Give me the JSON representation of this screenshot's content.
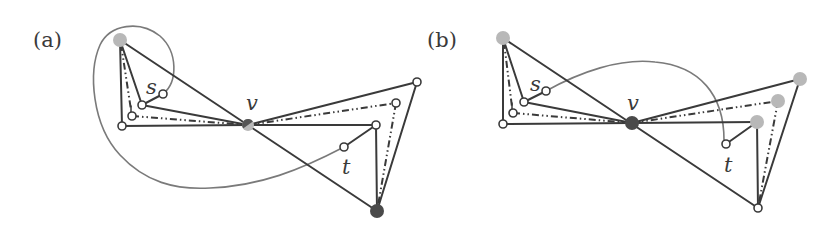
{
  "figure": {
    "panels": [
      {
        "id": "a",
        "label": "(a)",
        "vertex_labels": {
          "s": "s",
          "t": "t",
          "v": "v"
        },
        "nodes": {
          "top_left": {
            "x": 120,
            "y": 40,
            "style": "gray"
          },
          "corner": {
            "x": 122,
            "y": 126,
            "style": "open"
          },
          "small": {
            "x": 132,
            "y": 116,
            "style": "open"
          },
          "inner": {
            "x": 142,
            "y": 105,
            "style": "open"
          },
          "s": {
            "x": 163,
            "y": 94,
            "style": "open"
          },
          "v": {
            "x": 248,
            "y": 125,
            "style": "split-dark-gray"
          },
          "top_right": {
            "x": 417,
            "y": 82,
            "style": "open"
          },
          "dashdot_right": {
            "x": 396,
            "y": 103,
            "style": "open"
          },
          "mid_right": {
            "x": 376,
            "y": 125,
            "style": "open"
          },
          "t": {
            "x": 344,
            "y": 147,
            "style": "open"
          },
          "bottom": {
            "x": 377,
            "y": 211,
            "style": "dark"
          }
        }
      },
      {
        "id": "b",
        "label": "(b)",
        "vertex_labels": {
          "s": "s",
          "t": "t",
          "v": "v"
        },
        "nodes": {
          "top_left": {
            "x": 503,
            "y": 38,
            "style": "gray"
          },
          "corner": {
            "x": 503,
            "y": 124,
            "style": "open"
          },
          "small": {
            "x": 513,
            "y": 113,
            "style": "open"
          },
          "inner": {
            "x": 524,
            "y": 102,
            "style": "open"
          },
          "s": {
            "x": 546,
            "y": 91,
            "style": "open"
          },
          "v": {
            "x": 632,
            "y": 123,
            "style": "dark"
          },
          "top_right": {
            "x": 800,
            "y": 79,
            "style": "gray"
          },
          "dashdot_right": {
            "x": 778,
            "y": 101,
            "style": "gray"
          },
          "mid_right": {
            "x": 757,
            "y": 122,
            "style": "gray"
          },
          "t": {
            "x": 726,
            "y": 144,
            "style": "open"
          },
          "bottom": {
            "x": 758,
            "y": 208,
            "style": "open"
          }
        }
      }
    ],
    "colors": {
      "edge": "#3a3a3a",
      "curve": "#7a7a7a",
      "gray_node": "#b8b8b8",
      "dark_node": "#4a4a4a"
    }
  }
}
